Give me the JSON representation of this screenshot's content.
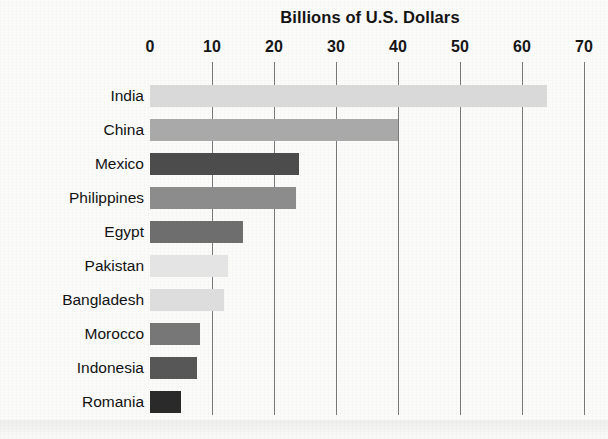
{
  "chart_data": {
    "type": "bar",
    "orientation": "horizontal",
    "title": "Billions of U.S. Dollars",
    "xlabel": "",
    "ylabel": "",
    "xlim": [
      0,
      70
    ],
    "xticks": [
      0,
      10,
      20,
      30,
      40,
      50,
      60,
      70
    ],
    "xticklabels": [
      "0",
      "10",
      "20",
      "30",
      "40",
      "50",
      "60",
      "70"
    ],
    "grid": "vertical",
    "legend": "none",
    "categories": [
      "India",
      "China",
      "Mexico",
      "Philippines",
      "Egypt",
      "Pakistan",
      "Bangladesh",
      "Morocco",
      "Indonesia",
      "Romania"
    ],
    "values": [
      64,
      40,
      24,
      23.5,
      15,
      12.5,
      12,
      8,
      7.5,
      5
    ],
    "bar_colors": [
      "#d9d9d9",
      "#a9a9a9",
      "#4c4c4c",
      "#8c8c8c",
      "#6e6e6e",
      "#e4e4e4",
      "#dddddd",
      "#777777",
      "#575757",
      "#2a2a2a"
    ],
    "bars": [
      {
        "label": "India",
        "value": 64,
        "color": "#d9d9d9"
      },
      {
        "label": "China",
        "value": 40,
        "color": "#a9a9a9"
      },
      {
        "label": "Mexico",
        "value": 24,
        "color": "#4c4c4c"
      },
      {
        "label": "Philippines",
        "value": 23.5,
        "color": "#8c8c8c"
      },
      {
        "label": "Egypt",
        "value": 15,
        "color": "#6e6e6e"
      },
      {
        "label": "Pakistan",
        "value": 12.5,
        "color": "#e4e4e4"
      },
      {
        "label": "Bangladesh",
        "value": 12,
        "color": "#dddddd"
      },
      {
        "label": "Morocco",
        "value": 8,
        "color": "#777777"
      },
      {
        "label": "Indonesia",
        "value": 7.5,
        "color": "#575757"
      },
      {
        "label": "Romania",
        "value": 5,
        "color": "#2a2a2a"
      }
    ]
  },
  "style": {
    "background": "#fbfbfa",
    "gridline_color": "#787878",
    "text_color": "#141414"
  }
}
